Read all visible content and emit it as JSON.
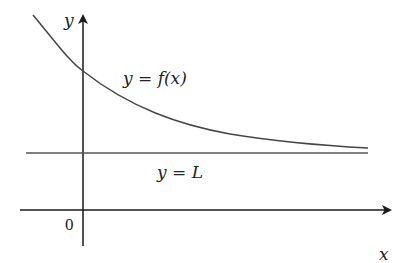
{
  "diagram": {
    "labels": {
      "y_axis": "y",
      "x_axis": "x",
      "origin": "0",
      "curve": "y = f(x)",
      "asymptote": "y = L"
    },
    "colors": {
      "axes": "#1a1a1a",
      "curve": "#444444",
      "asymptote": "#555555",
      "text": "#222222"
    }
  }
}
